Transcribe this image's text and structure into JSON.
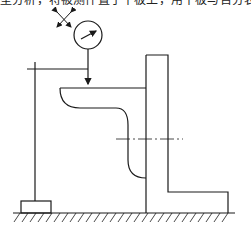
{
  "caption": {
    "text": "型分析，将被测件置于平板上，用平板与百分表测量"
  },
  "diagram": {
    "elements": [
      {
        "name": "direction-cross-arrows-icon"
      },
      {
        "name": "dial-gauge"
      },
      {
        "name": "indicator-stand"
      },
      {
        "name": "stand-base-block"
      },
      {
        "name": "workpiece-L-bracket"
      },
      {
        "name": "centerline"
      },
      {
        "name": "surface-plate-ground-hatch"
      }
    ],
    "colors": {
      "line": "#1a1a1a",
      "background": "#ffffff"
    }
  }
}
